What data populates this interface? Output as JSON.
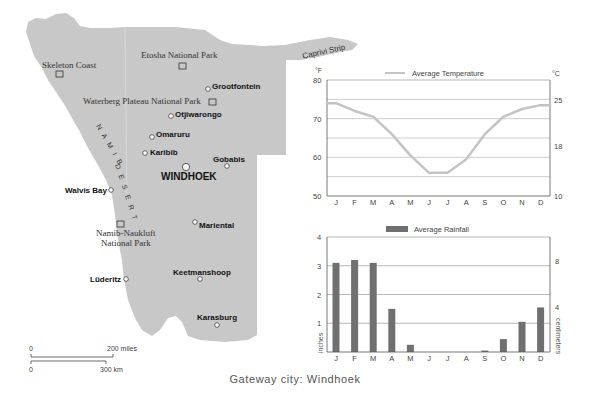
{
  "map": {
    "fill_color": "#c8c8c8",
    "regions": [
      {
        "name": "Caprivi Strip",
        "type": "region-label"
      },
      {
        "name": "NAMIB DESERT",
        "type": "region-label"
      }
    ],
    "parks": [
      {
        "name": "Skeleton Coast"
      },
      {
        "name": "Etosha National Park"
      },
      {
        "name": "Waterberg Plateau National Park"
      },
      {
        "name": "Namib-Naukluft",
        "name_line2": "National Park"
      }
    ],
    "cities": [
      {
        "name": "Grootfontein"
      },
      {
        "name": "Otjiwarongo"
      },
      {
        "name": "Omaruru"
      },
      {
        "name": "Karibib"
      },
      {
        "name": "WINDHOEK",
        "capital": true
      },
      {
        "name": "Gobabis"
      },
      {
        "name": "Walvis Bay"
      },
      {
        "name": "Mariental"
      },
      {
        "name": "Lüderitz"
      },
      {
        "name": "Keetmanshoop"
      },
      {
        "name": "Karasburg"
      }
    ],
    "scale": {
      "miles_zero": "0",
      "miles_label": "200 miles",
      "km_zero": "0",
      "km_label": "300 km"
    }
  },
  "caption": "Gateway city: Windhoek",
  "chart_data": [
    {
      "type": "line",
      "title": "Average Temperature",
      "legend": "Average Temperature",
      "categories": [
        "J",
        "F",
        "M",
        "A",
        "M",
        "J",
        "J",
        "A",
        "S",
        "O",
        "N",
        "D"
      ],
      "values": [
        74,
        72,
        70.5,
        66,
        60.5,
        56,
        56,
        59.5,
        66,
        70.5,
        72.5,
        73.5
      ],
      "ylabel_left": "°F",
      "ylabel_right": "°C",
      "ylim": [
        50,
        80
      ],
      "yticks_left": [
        "80",
        "70",
        "60",
        "50"
      ],
      "yticks_right": [
        "25",
        "18",
        "10"
      ],
      "grid": true,
      "line_color": "#c4c4c4"
    },
    {
      "type": "bar",
      "title": "Average Rainfall",
      "legend": "Average Rainfall",
      "categories": [
        "J",
        "F",
        "M",
        "A",
        "M",
        "J",
        "J",
        "A",
        "S",
        "O",
        "N",
        "D"
      ],
      "values": [
        3.1,
        3.2,
        3.1,
        1.5,
        0.25,
        0,
        0,
        0,
        0.05,
        0.45,
        1.05,
        1.55
      ],
      "ylabel_left": "inches",
      "ylabel_right": "centimeters",
      "ylim": [
        0,
        4
      ],
      "yticks_left": [
        "4",
        "3",
        "2",
        "1"
      ],
      "yticks_right": [
        "8",
        "4"
      ],
      "grid": true,
      "bar_color": "#707070"
    }
  ]
}
